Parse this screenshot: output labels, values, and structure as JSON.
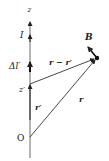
{
  "diagram": {
    "labels": {
      "z_axis": "z",
      "current": "I",
      "element": "Δl′",
      "z_prime": "z′",
      "r_prime": "r′",
      "origin": "O",
      "field": "B",
      "r": "r",
      "r_minus_r_prime": "r − r′"
    },
    "colors": {
      "line": "#333333",
      "text": "#222222",
      "background": "#ffffff"
    }
  }
}
